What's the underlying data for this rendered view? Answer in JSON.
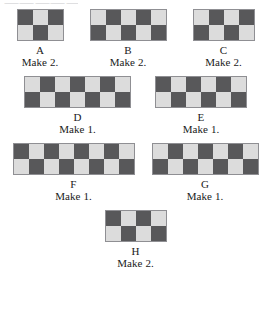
{
  "artifact": {
    "clipped_header_text": "⸺⸺⸺⸺⸺⸺"
  },
  "palette": {
    "dark_fabric": "#58585a",
    "light_fabric": "#dcdcdc",
    "block_border": "#8f8f93",
    "page_background": "#ffffff",
    "text": "#1a1a1a"
  },
  "diagram": {
    "type": "quilt-block-cutting-chart",
    "cell_colors": [
      "dark",
      "light"
    ],
    "rows_of_blocks": [
      [
        "A",
        "B",
        "C"
      ],
      [
        "D",
        "E"
      ],
      [
        "F",
        "G"
      ],
      [
        "H"
      ]
    ],
    "blocks": [
      {
        "id": "A",
        "label": "A",
        "make": "Make 2.",
        "columns": 3,
        "rows": 2,
        "top_left": "dark",
        "grid": [
          [
            "dark",
            "light",
            "dark"
          ],
          [
            "light",
            "dark",
            "light"
          ]
        ]
      },
      {
        "id": "B",
        "label": "B",
        "make": "Make 2.",
        "columns": 5,
        "rows": 2,
        "top_left": "light",
        "grid": [
          [
            "light",
            "dark",
            "light",
            "dark",
            "light"
          ],
          [
            "dark",
            "light",
            "dark",
            "light",
            "dark"
          ]
        ]
      },
      {
        "id": "C",
        "label": "C",
        "make": "Make 2.",
        "columns": 4,
        "rows": 2,
        "top_left": "light",
        "grid": [
          [
            "light",
            "dark",
            "light",
            "dark"
          ],
          [
            "dark",
            "light",
            "dark",
            "light"
          ]
        ]
      },
      {
        "id": "D",
        "label": "D",
        "make": "Make 1.",
        "columns": 7,
        "rows": 2,
        "top_left": "light",
        "grid": [
          [
            "light",
            "dark",
            "light",
            "dark",
            "light",
            "dark",
            "light"
          ],
          [
            "dark",
            "light",
            "dark",
            "light",
            "dark",
            "light",
            "dark"
          ]
        ]
      },
      {
        "id": "E",
        "label": "E",
        "make": "Make 1.",
        "columns": 6,
        "rows": 2,
        "top_left": "dark",
        "grid": [
          [
            "dark",
            "light",
            "dark",
            "light",
            "dark",
            "light"
          ],
          [
            "light",
            "dark",
            "light",
            "dark",
            "light",
            "dark"
          ]
        ]
      },
      {
        "id": "F",
        "label": "F",
        "make": "Make 1.",
        "columns": 8,
        "rows": 2,
        "top_left": "dark",
        "grid": [
          [
            "dark",
            "light",
            "dark",
            "light",
            "dark",
            "light",
            "dark",
            "light"
          ],
          [
            "light",
            "dark",
            "light",
            "dark",
            "light",
            "dark",
            "light",
            "dark"
          ]
        ]
      },
      {
        "id": "G",
        "label": "G",
        "make": "Make 1.",
        "columns": 7,
        "rows": 2,
        "top_left": "light",
        "grid": [
          [
            "light",
            "dark",
            "light",
            "dark",
            "light",
            "dark",
            "light"
          ],
          [
            "dark",
            "light",
            "dark",
            "light",
            "dark",
            "light",
            "dark"
          ]
        ]
      },
      {
        "id": "H",
        "label": "H",
        "make": "Make 2.",
        "columns": 4,
        "rows": 2,
        "top_left": "dark",
        "grid": [
          [
            "dark",
            "light",
            "dark",
            "light"
          ],
          [
            "light",
            "dark",
            "light",
            "dark"
          ]
        ]
      }
    ]
  }
}
